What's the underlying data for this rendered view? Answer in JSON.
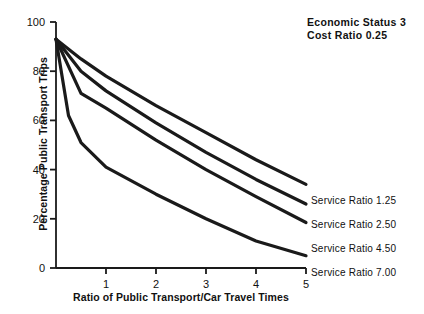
{
  "annotation": {
    "line1": "Economic Status 3",
    "line2": "Cost Ratio 0.25"
  },
  "axes": {
    "x_title": "Ratio of Public Transport/Car Travel Times",
    "y_title": "Percentage Public Transport Trips"
  },
  "series_labels": {
    "s1": "Service Ratio 1.25",
    "s2": "Service Ratio 2.50",
    "s3": "Service Ratio 4.50",
    "s4": "Service Ratio 7.00"
  },
  "ticks": {
    "x": [
      "0",
      "1",
      "2",
      "3",
      "4",
      "5"
    ],
    "y": [
      "0",
      "20",
      "40",
      "60",
      "80",
      "100"
    ]
  },
  "colors": {
    "background": "#ffffff",
    "ink": "#111111",
    "curve": "#1a1a1a",
    "axis": "#1a1a1a"
  },
  "chart_data": {
    "type": "line",
    "title": "",
    "subtitle": "",
    "xlabel": "Ratio of Public Transport/Car Travel Times",
    "ylabel": "Percentage Public Transport Trips",
    "xlim": [
      0,
      5
    ],
    "ylim": [
      0,
      100
    ],
    "xticks": [
      0,
      1,
      2,
      3,
      4,
      5
    ],
    "yticks": [
      0,
      20,
      40,
      60,
      80,
      100
    ],
    "grid": false,
    "legend": "end-of-line labels, right side",
    "annotations": [
      "Economic Status 3",
      "Cost Ratio 0.25"
    ],
    "series": [
      {
        "name": "Service Ratio 1.25",
        "x": [
          0,
          0.5,
          1,
          2,
          3,
          4,
          5
        ],
        "values": [
          93,
          85,
          78,
          66,
          55,
          44,
          34
        ]
      },
      {
        "name": "Service Ratio 2.50",
        "x": [
          0,
          0.5,
          1,
          2,
          3,
          4,
          5
        ],
        "values": [
          93,
          80,
          72,
          59,
          47,
          36,
          26
        ]
      },
      {
        "name": "Service Ratio 4.50",
        "x": [
          0,
          0.5,
          1,
          2,
          3,
          4,
          5
        ],
        "values": [
          93,
          71,
          65,
          52,
          40,
          29,
          18.5
        ]
      },
      {
        "name": "Service Ratio 7.00",
        "x": [
          0,
          0.25,
          0.5,
          1,
          2,
          3,
          4,
          5
        ],
        "values": [
          93,
          62,
          51,
          41,
          30,
          20,
          11,
          5
        ]
      }
    ]
  }
}
